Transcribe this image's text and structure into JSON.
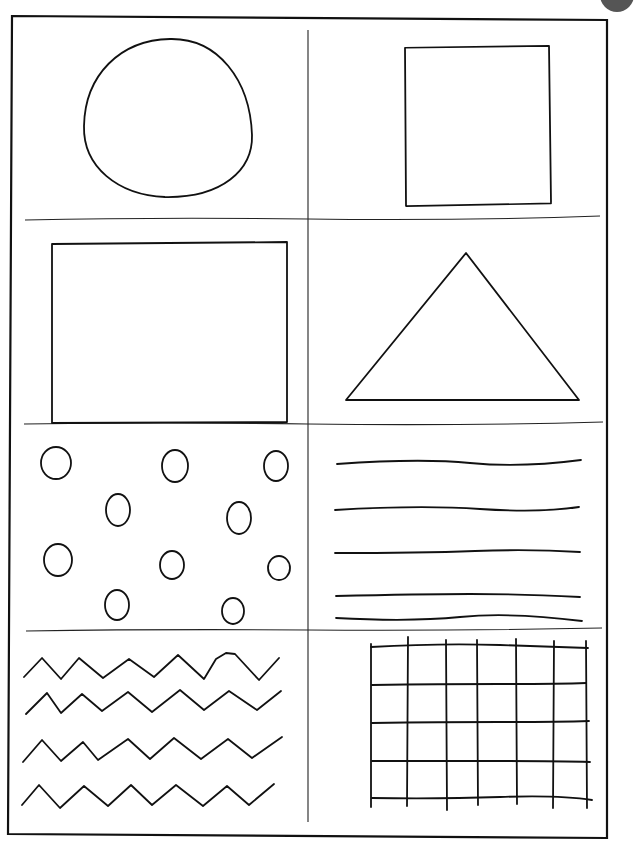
{
  "worksheet": {
    "title": "",
    "ink_color": "#111111",
    "paper_color": "#ffffff",
    "panels": [
      {
        "id": "circle",
        "shape": "circle"
      },
      {
        "id": "square",
        "shape": "square"
      },
      {
        "id": "rectangle",
        "shape": "rectangle"
      },
      {
        "id": "triangle",
        "shape": "triangle"
      },
      {
        "id": "dots",
        "shape": "small circles",
        "count": 11
      },
      {
        "id": "lines",
        "shape": "horizontal lines",
        "count": 5
      },
      {
        "id": "zigzag",
        "shape": "zigzag lines",
        "count": 4
      },
      {
        "id": "grid",
        "shape": "grid",
        "columns": 6,
        "rows": 4
      }
    ]
  }
}
